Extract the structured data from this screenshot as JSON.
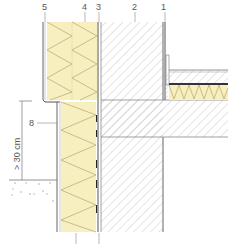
{
  "labels": {
    "l1": "1",
    "l2": "2",
    "l3": "3",
    "l4": "4",
    "l5": "5",
    "l8": "8",
    "dimension": "> 30 cm"
  },
  "colors": {
    "insulation": "#f8efc0",
    "insulation_zigzag": "#b5a66a",
    "hatch": "#b8b8b8",
    "line": "#777777",
    "dark": "#333333"
  }
}
